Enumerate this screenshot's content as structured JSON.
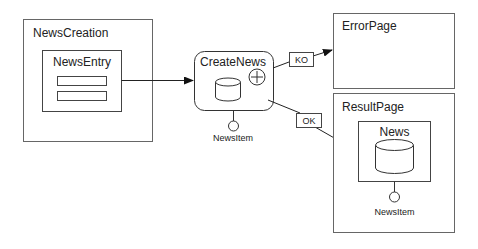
{
  "diagram": {
    "nodes": {
      "news_creation": {
        "label": "NewsCreation"
      },
      "news_entry": {
        "label": "NewsEntry"
      },
      "create_news": {
        "label": "CreateNews",
        "param": "NewsItem"
      },
      "error_page": {
        "label": "ErrorPage"
      },
      "result_page": {
        "label": "ResultPage"
      },
      "news": {
        "label": "News",
        "param": "NewsItem"
      }
    },
    "edges": {
      "ko": {
        "label": "KO"
      },
      "ok": {
        "label": "OK"
      }
    }
  }
}
